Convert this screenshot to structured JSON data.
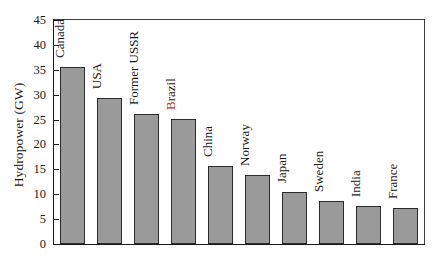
{
  "chart_data": {
    "type": "bar",
    "title": "",
    "subtitle": "",
    "xlabel": "",
    "ylabel": "Hydropower (GW)",
    "categories": [
      "Canada",
      "USA",
      "Former USSR",
      "Brazil",
      "China",
      "Norway",
      "Japan",
      "Sweden",
      "India",
      "France"
    ],
    "values": [
      35.5,
      29.3,
      26.2,
      25.2,
      15.6,
      13.9,
      10.4,
      8.6,
      7.7,
      7.3
    ],
    "series": [
      {
        "name": "Hydropower",
        "values": [
          35.5,
          29.3,
          26.2,
          25.2,
          15.6,
          13.9,
          10.4,
          8.6,
          7.7,
          7.3
        ]
      }
    ],
    "ylim": [
      0,
      45
    ],
    "yticks": [
      0,
      5,
      10,
      15,
      20,
      25,
      30,
      35,
      40,
      45
    ],
    "ytick_labels": [
      "0",
      "5",
      "10",
      "15",
      "20",
      "25",
      "30",
      "35",
      "40",
      "45"
    ],
    "grid": false,
    "legend": false,
    "legend_position": "none",
    "bar_color": "#9a9a9a",
    "bar_edge_color": "#2b2b2b",
    "axis_color": "#1a1a1a",
    "label_rotation": 90,
    "annotations": [
      {
        "text": "Brazil",
        "note": "label rendered with first letter in red",
        "highlight_color": "#c0392b"
      }
    ]
  }
}
